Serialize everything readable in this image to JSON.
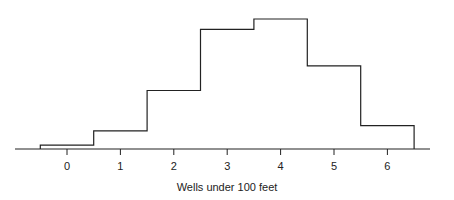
{
  "chart_data": {
    "type": "bar",
    "style": "step-histogram",
    "title": "",
    "xlabel": "Wells under 100 feet",
    "ylabel": "",
    "categories": [
      "0",
      "1",
      "2",
      "3",
      "4",
      "5",
      "6"
    ],
    "bin_edges": [
      -0.5,
      0.5,
      1.5,
      2.5,
      3.5,
      4.5,
      5.5,
      6.5
    ],
    "values": [
      3,
      14,
      45,
      92,
      100,
      64,
      18
    ],
    "value_units": "relative height (no y-axis shown; max bin = 100)",
    "x_ticks": [
      0,
      1,
      2,
      3,
      4,
      5,
      6
    ],
    "xlim": [
      -1.0,
      6.85
    ],
    "ylim": [
      0,
      100
    ],
    "grid": false,
    "legend": null,
    "y_axis_visible": false
  },
  "colors": {
    "line": "#222222",
    "axis": "#222222",
    "background": "#ffffff"
  }
}
